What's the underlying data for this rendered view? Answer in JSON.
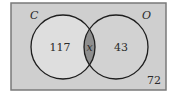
{
  "diagram": {
    "type": "venn",
    "universe": {
      "value": "72",
      "fill": "#cfcfcf",
      "border": "#7a7a7a"
    },
    "sets": [
      {
        "name": "C",
        "only_value": "117",
        "fill": "#dedede"
      },
      {
        "name": "O",
        "only_value": "43",
        "fill": "#d2d2d2"
      }
    ],
    "intersection": {
      "value": "x",
      "fill": "#8e8e8e"
    },
    "stroke": "#1e1e1e"
  }
}
